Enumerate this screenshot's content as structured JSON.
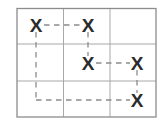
{
  "figure": {
    "kind": "grid-diagram",
    "mark_glyph": "X",
    "colors": {
      "background": "#ffffff",
      "grid_outer": "#8c8c8c",
      "grid_inner": "#a8a8a8",
      "mark": "#2b2b2b",
      "dash": "#8c8c8c"
    },
    "grid": {
      "rows": 3,
      "columns": 3,
      "left": 17,
      "top": 8.5,
      "right": 156,
      "bottom": 117,
      "v_lines": [
        63.5,
        110.0
      ],
      "h_lines": [
        44.0,
        81.0
      ]
    },
    "cells": [
      {
        "id": "r1c1",
        "row": 1,
        "col": 1,
        "mark": "X",
        "cx": 36,
        "cy": 25
      },
      {
        "id": "r1c2",
        "row": 1,
        "col": 2,
        "mark": "X",
        "cx": 88,
        "cy": 25
      },
      {
        "id": "r1c3",
        "row": 1,
        "col": 3,
        "mark": "",
        "cx": 133,
        "cy": 25
      },
      {
        "id": "r2c1",
        "row": 2,
        "col": 1,
        "mark": "",
        "cx": 36,
        "cy": 63
      },
      {
        "id": "r2c2",
        "row": 2,
        "col": 2,
        "mark": "X",
        "cx": 88,
        "cy": 63
      },
      {
        "id": "r2c3",
        "row": 2,
        "col": 3,
        "mark": "X",
        "cx": 137,
        "cy": 63
      },
      {
        "id": "r3c1",
        "row": 3,
        "col": 1,
        "mark": "",
        "cx": 36,
        "cy": 100
      },
      {
        "id": "r3c2",
        "row": 3,
        "col": 2,
        "mark": "",
        "cx": 88,
        "cy": 100
      },
      {
        "id": "r3c3",
        "row": 3,
        "col": 3,
        "mark": "X",
        "cx": 137,
        "cy": 100
      }
    ],
    "connectors": [
      {
        "id": "c1",
        "from": "r1c1",
        "to": "r1c2",
        "orientation": "horizontal",
        "x1": 44,
        "y1": 25,
        "x2": 80,
        "y2": 25
      },
      {
        "id": "c2",
        "from": "r1c2",
        "to": "r2c2",
        "orientation": "vertical",
        "x1": 88,
        "y1": 32,
        "x2": 88,
        "y2": 56
      },
      {
        "id": "c3",
        "from": "r2c2",
        "to": "r2c3",
        "orientation": "horizontal",
        "x1": 96,
        "y1": 63,
        "x2": 130,
        "y2": 63
      },
      {
        "id": "c4",
        "from": "r2c3",
        "to": "r3c3",
        "orientation": "vertical",
        "x1": 137,
        "y1": 70,
        "x2": 137,
        "y2": 93
      },
      {
        "id": "c5",
        "from": "r1c1",
        "to": "corner",
        "orientation": "vertical",
        "x1": 36,
        "y1": 32,
        "x2": 36,
        "y2": 100
      },
      {
        "id": "c6",
        "from": "corner",
        "to": "r3c3",
        "orientation": "horizontal",
        "x1": 36,
        "y1": 100,
        "x2": 130,
        "y2": 100
      }
    ]
  }
}
